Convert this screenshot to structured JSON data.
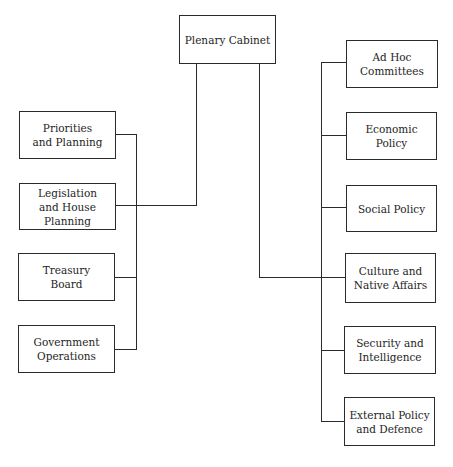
{
  "diagram": {
    "type": "org-chart",
    "root": {
      "id": "plenary",
      "label": "Plenary Cabinet"
    },
    "left_branch": [
      {
        "id": "priorities",
        "label": "Priorities\nand Planning"
      },
      {
        "id": "legislation",
        "label": "Legislation\nand House\nPlanning"
      },
      {
        "id": "treasury",
        "label": "Treasury\nBoard"
      },
      {
        "id": "government-operations",
        "label": "Government\nOperations"
      }
    ],
    "right_branch": [
      {
        "id": "ad-hoc",
        "label": "Ad Hoc\nCommittees"
      },
      {
        "id": "economic",
        "label": "Economic\nPolicy"
      },
      {
        "id": "social",
        "label": "Social Policy"
      },
      {
        "id": "culture",
        "label": "Culture and\nNative Affairs"
      },
      {
        "id": "security",
        "label": "Security and\nIntelligence"
      },
      {
        "id": "external",
        "label": "External Policy\nand Defence"
      }
    ],
    "connections": [
      {
        "from": "plenary",
        "to": "legislation",
        "via": "left-bus"
      },
      {
        "from": "plenary",
        "to": "culture",
        "via": "right-bus"
      }
    ]
  }
}
